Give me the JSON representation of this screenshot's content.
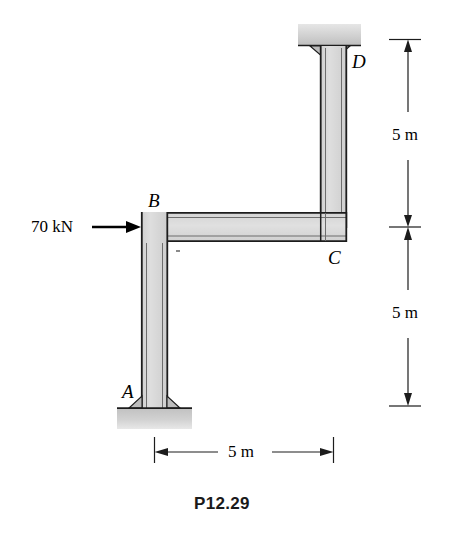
{
  "figure": {
    "caption": "P12.29",
    "joint_labels": [
      {
        "name": "A",
        "text": "A"
      },
      {
        "name": "B",
        "text": "B"
      },
      {
        "name": "C",
        "text": "C"
      },
      {
        "name": "D",
        "text": "D"
      }
    ],
    "load": {
      "label": "70 kN",
      "direction": "right",
      "applied_at": "B"
    },
    "dimensions": [
      {
        "name": "horizontal-span-ab-to-c",
        "text": "5 m",
        "orientation": "horizontal"
      },
      {
        "name": "vertical-upper-c-to-d",
        "text": "5 m",
        "orientation": "vertical"
      },
      {
        "name": "vertical-lower-a-to-c",
        "text": "5 m",
        "orientation": "vertical"
      }
    ],
    "colors": {
      "line": "#1c1c1c",
      "member_fill": "#d6d6d6",
      "member_fill_light": "#e2e2e2",
      "support_fill": "#c9c9c9",
      "background": "#ffffff"
    }
  }
}
